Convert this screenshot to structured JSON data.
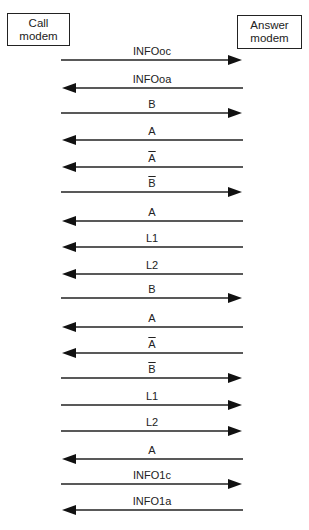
{
  "diagram": {
    "type": "sequence",
    "participants": {
      "left": {
        "line1": "Call",
        "line2": "modem"
      },
      "right": {
        "line1": "Answer",
        "line2": "modem"
      }
    },
    "messages": [
      {
        "label": "INFOoc",
        "direction": "right",
        "overline": false,
        "y": 60
      },
      {
        "label": "INFOoa",
        "direction": "left",
        "overline": false,
        "y": 88
      },
      {
        "label": "B",
        "direction": "right",
        "overline": false,
        "y": 113
      },
      {
        "label": "A",
        "direction": "left",
        "overline": false,
        "y": 140
      },
      {
        "label": "A",
        "direction": "left",
        "overline": true,
        "y": 167
      },
      {
        "label": "B",
        "direction": "right",
        "overline": true,
        "y": 192
      },
      {
        "label": "A",
        "direction": "left",
        "overline": false,
        "y": 221
      },
      {
        "label": "L1",
        "direction": "left",
        "overline": false,
        "y": 247
      },
      {
        "label": "L2",
        "direction": "left",
        "overline": false,
        "y": 274
      },
      {
        "label": "B",
        "direction": "right",
        "overline": false,
        "y": 298
      },
      {
        "label": "A",
        "direction": "left",
        "overline": false,
        "y": 327
      },
      {
        "label": "A",
        "direction": "left",
        "overline": true,
        "y": 353
      },
      {
        "label": "B",
        "direction": "right",
        "overline": true,
        "y": 378
      },
      {
        "label": "L1",
        "direction": "right",
        "overline": false,
        "y": 405
      },
      {
        "label": "L2",
        "direction": "right",
        "overline": false,
        "y": 431
      },
      {
        "label": "A",
        "direction": "left",
        "overline": false,
        "y": 459
      },
      {
        "label": "INFO1c",
        "direction": "right",
        "overline": false,
        "y": 484
      },
      {
        "label": "INFO1a",
        "direction": "left",
        "overline": false,
        "y": 510
      }
    ]
  }
}
